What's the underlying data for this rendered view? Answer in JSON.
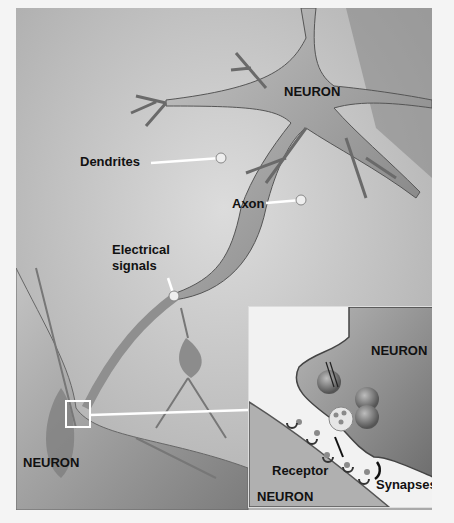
{
  "diagram": {
    "labels": {
      "neuron_top": "NEURON",
      "dendrites": "Dendrites",
      "axon": "Axon",
      "electrical_signals_line1": "Electrical",
      "electrical_signals_line2": "signals",
      "neuron_bottom_left": "NEURON"
    },
    "inset": {
      "neuron_top": "NEURON",
      "receptor": "Receptor",
      "synapses": "Synapses",
      "neuron_bottom": "NEURON"
    },
    "colors": {
      "background": "#c9c9c9",
      "neuron_body": "#9a9a9a",
      "inset_background": "#f2f2f2",
      "label_text": "#111111",
      "pointer_line": "#ffffff"
    }
  }
}
